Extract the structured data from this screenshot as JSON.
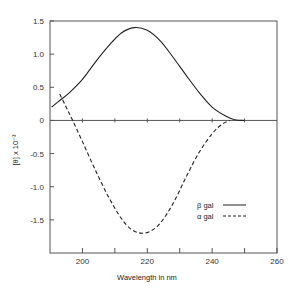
{
  "chart_data": {
    "type": "line",
    "title": "",
    "xlabel": "Wavelength  in  nm",
    "ylabel": "[θ] x 10⁻³",
    "xlim": [
      190,
      260
    ],
    "ylim": [
      -2.0,
      1.5
    ],
    "xticks": [
      200,
      210,
      220,
      230,
      240,
      250,
      260
    ],
    "xtick_labels": [
      "200",
      "",
      "220",
      "",
      "240",
      "",
      "260"
    ],
    "yticks": [
      1.5,
      1.0,
      0.5,
      0,
      -0.5,
      -1.0,
      -1.5
    ],
    "ytick_labels": [
      "1.5",
      "1.0",
      "0.5",
      "0",
      "-0.5",
      "-1.0",
      "-1.5"
    ],
    "grid": false,
    "zero_line": true,
    "legend_position": "lower right (inside)",
    "series": [
      {
        "name": "β gal",
        "style": "solid",
        "x": [
          190.5,
          193,
          196,
          200,
          204,
          208,
          212,
          216,
          220,
          224,
          228,
          232,
          236,
          240,
          244,
          247,
          250
        ],
        "values": [
          0.2,
          0.3,
          0.42,
          0.62,
          0.88,
          1.12,
          1.32,
          1.4,
          1.36,
          1.2,
          0.95,
          0.68,
          0.42,
          0.2,
          0.07,
          0.01,
          0.0
        ]
      },
      {
        "name": "α gal",
        "style": "dashed",
        "x": [
          193,
          195,
          197,
          200,
          204,
          208,
          212,
          215,
          218,
          221,
          224,
          228,
          232,
          236,
          240,
          243,
          245.5
        ],
        "values": [
          0.4,
          0.2,
          0.0,
          -0.32,
          -0.75,
          -1.15,
          -1.48,
          -1.64,
          -1.7,
          -1.67,
          -1.55,
          -1.25,
          -0.85,
          -0.48,
          -0.2,
          -0.06,
          0.0
        ]
      }
    ]
  },
  "legend": {
    "items": [
      {
        "label": "β gal",
        "style": "solid"
      },
      {
        "label": "α gal",
        "style": "dashed"
      }
    ]
  }
}
